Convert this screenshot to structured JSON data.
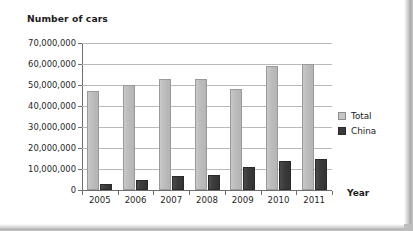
{
  "chart_data": {
    "type": "bar",
    "title": "Number of cars",
    "xlabel": "Year",
    "ylabel": "",
    "categories": [
      "2005",
      "2006",
      "2007",
      "2008",
      "2009",
      "2010",
      "2011"
    ],
    "series": [
      {
        "name": "Total",
        "color": "#bdbdbd",
        "values": [
          47000000,
          50000000,
          53000000,
          53000000,
          48000000,
          59000000,
          60000000
        ]
      },
      {
        "name": "China",
        "color": "#3a3a3a",
        "values": [
          3000000,
          5000000,
          6500000,
          7000000,
          11000000,
          14000000,
          15000000
        ]
      }
    ],
    "ylim": [
      0,
      70000000
    ],
    "ytick_values": [
      0,
      10000000,
      20000000,
      30000000,
      40000000,
      50000000,
      60000000,
      70000000
    ],
    "ytick_labels": [
      "0",
      "10,000,000",
      "20,000,000",
      "30,000,000",
      "40,000,000",
      "50,000,000",
      "60,000,000",
      "70,000,000"
    ],
    "grid": true,
    "legend_position": "right"
  },
  "legend": {
    "entries": [
      {
        "label": "Total",
        "swatch": "total"
      },
      {
        "label": "China",
        "swatch": "china"
      }
    ]
  }
}
